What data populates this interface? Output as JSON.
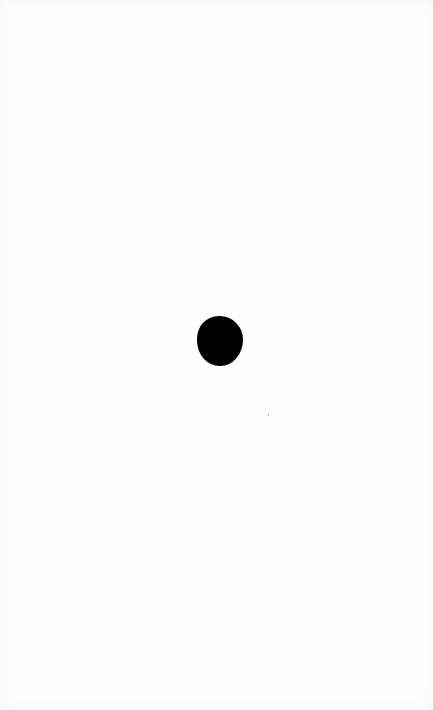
{
  "page": {
    "background": "#ffffff",
    "content": "single black dot"
  },
  "dot": {
    "color": "#000000",
    "shape": "circle",
    "center_x": 220,
    "center_y": 341,
    "width": 46,
    "height": 50
  }
}
